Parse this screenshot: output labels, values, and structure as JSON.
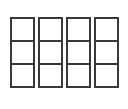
{
  "diagram": {
    "columns": 4,
    "rows": 3,
    "line_color": "#3a3a3a",
    "background": "#ffffff",
    "cells": [
      [
        "",
        "",
        ""
      ],
      [
        "",
        "",
        ""
      ],
      [
        "",
        "",
        ""
      ],
      [
        "",
        "",
        ""
      ]
    ]
  }
}
